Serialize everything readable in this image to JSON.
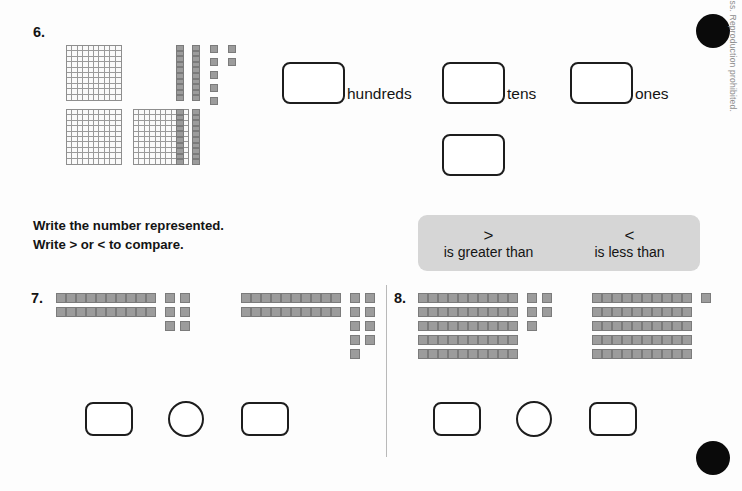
{
  "page": {
    "copyright": "© 2015 BJU Press. Reproduction prohibited.",
    "directions_line1": "Write the number represented.",
    "directions_line2": "Write > or < to compare."
  },
  "legend": {
    "greater_symbol": ">",
    "greater_label": "is greater than",
    "less_symbol": "<",
    "less_label": "is less than"
  },
  "problem6": {
    "number": "6.",
    "hundreds_label": "hundreds",
    "tens_label": "tens",
    "ones_label": "ones",
    "hundreds_value": "",
    "tens_value": "",
    "ones_value": "",
    "total_value": "",
    "blocks": {
      "flats": 3,
      "rods": 4,
      "units": 7,
      "represented_number": 347
    }
  },
  "problem7": {
    "number": "7.",
    "left": {
      "rods": 2,
      "units": 6,
      "value": 26,
      "answer": ""
    },
    "right": {
      "rods": 2,
      "units": 9,
      "value": 29,
      "answer": ""
    },
    "comparison_answer": ""
  },
  "problem8": {
    "number": "8.",
    "left": {
      "rods": 5,
      "units": 5,
      "value": 55,
      "answer": ""
    },
    "right": {
      "rods": 5,
      "units": 1,
      "value": 51,
      "answer": ""
    },
    "comparison_answer": ""
  },
  "colors": {
    "block_fill": "#9c9c9c",
    "block_stroke": "#7b7b7b",
    "flat_stroke": "#8e8e8e",
    "outline": "#1d1d1d",
    "legend_bg": "#d6d6d6",
    "registration_dot": "#0a0a0a"
  }
}
